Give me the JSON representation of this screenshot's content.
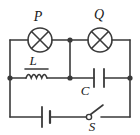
{
  "figure": {
    "name": "ac-circuit-diagram",
    "background": "#ffffff",
    "stroke_color": "#3a3a3a",
    "label_color": "#1a1a1a",
    "stroke_width": 1.6
  },
  "labels": {
    "lamp_p": "P",
    "lamp_q": "Q",
    "inductor": "L",
    "capacitor": "C",
    "switch": "S"
  },
  "components": [
    {
      "id": "lamp-p",
      "symbol": "lamp-x-in-circle",
      "label": "P",
      "branch": "top-rail",
      "position": "left"
    },
    {
      "id": "lamp-q",
      "symbol": "lamp-x-in-circle",
      "label": "Q",
      "branch": "top-rail",
      "position": "right"
    },
    {
      "id": "inductor-l",
      "symbol": "inductor-coil-with-core",
      "label": "L",
      "branch": "middle-rail",
      "position": "left"
    },
    {
      "id": "capacitor-c",
      "symbol": "capacitor-parallel-plates",
      "label": "C",
      "branch": "middle-rail",
      "position": "right"
    },
    {
      "id": "battery",
      "symbol": "battery-cell",
      "label": "",
      "branch": "bottom-rail",
      "position": "left"
    },
    {
      "id": "switch-s",
      "symbol": "switch-open",
      "label": "S",
      "branch": "bottom-rail",
      "position": "right",
      "state": "open"
    }
  ],
  "junctions": [
    {
      "id": "node-left-middle",
      "x": 10,
      "y": 78
    },
    {
      "id": "node-center-top",
      "x": 70,
      "y": 40
    },
    {
      "id": "node-center-middle",
      "x": 70,
      "y": 78
    },
    {
      "id": "node-right-middle",
      "x": 130,
      "y": 78
    }
  ],
  "rails": [
    {
      "id": "top-rail",
      "y": 40
    },
    {
      "id": "middle-rail",
      "y": 78
    },
    {
      "id": "bottom-rail",
      "y": 117
    }
  ]
}
